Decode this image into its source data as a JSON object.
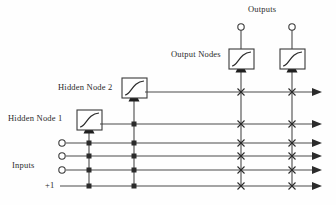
{
  "figure": {
    "type": "diagram",
    "background_color": "#fefefe",
    "line_color": "#4a4a4a",
    "marker_color": "#2b2b2b"
  },
  "labels": {
    "hidden_node_1": "Hidden Node 1",
    "hidden_node_2": "Hidden Node 2",
    "output_nodes": "Output Nodes",
    "outputs": "Outputs",
    "inputs": "Inputs",
    "bias": "+1"
  },
  "geometry": {
    "width": 336,
    "height": 205,
    "bus_rows": [
      {
        "name": "hidden-2-bus",
        "y": 92,
        "x_start": 145,
        "x_end": 322
      },
      {
        "name": "hidden-1-bus",
        "y": 124,
        "x_start": 100,
        "x_end": 322
      },
      {
        "name": "input-1-bus",
        "y": 143,
        "x_start": 64,
        "x_end": 322
      },
      {
        "name": "input-2-bus",
        "y": 156,
        "x_start": 64,
        "x_end": 322
      },
      {
        "name": "input-3-bus",
        "y": 170,
        "x_start": 64,
        "x_end": 322
      },
      {
        "name": "bias-bus",
        "y": 186,
        "x_start": 60,
        "x_end": 322
      }
    ],
    "vertical_lines": [
      {
        "name": "hidden-1-column",
        "x": 89,
        "y_top": 135,
        "y_bottom": 186
      },
      {
        "name": "hidden-2-column",
        "x": 134,
        "y_top": 103,
        "y_bottom": 186
      },
      {
        "name": "output-1-column",
        "x": 241,
        "y_top": 74,
        "y_bottom": 186
      },
      {
        "name": "output-2-column",
        "x": 292,
        "y_top": 74,
        "y_bottom": 186
      }
    ],
    "input_terminals": [
      {
        "name": "input-terminal-1",
        "x": 62,
        "y": 143
      },
      {
        "name": "input-terminal-2",
        "x": 62,
        "y": 156
      },
      {
        "name": "input-terminal-3",
        "x": 62,
        "y": 170
      }
    ],
    "output_terminals": [
      {
        "name": "output-terminal-1",
        "x": 241,
        "y": 28
      },
      {
        "name": "output-terminal-2",
        "x": 292,
        "y": 28
      }
    ],
    "nodes": [
      {
        "name": "hidden-node-1",
        "x": 77,
        "y": 110,
        "w": 25,
        "h": 20
      },
      {
        "name": "hidden-node-2",
        "x": 122,
        "y": 78,
        "w": 25,
        "h": 20
      },
      {
        "name": "output-node-1",
        "x": 229,
        "y": 49,
        "w": 25,
        "h": 20
      },
      {
        "name": "output-node-2",
        "x": 280,
        "y": 49,
        "w": 25,
        "h": 20
      }
    ],
    "connection_dots": [
      {
        "x": 89,
        "y": 143
      },
      {
        "x": 89,
        "y": 156
      },
      {
        "x": 89,
        "y": 170
      },
      {
        "x": 89,
        "y": 186
      },
      {
        "x": 134,
        "y": 124
      },
      {
        "x": 134,
        "y": 143
      },
      {
        "x": 134,
        "y": 156
      },
      {
        "x": 134,
        "y": 170
      },
      {
        "x": 134,
        "y": 186
      }
    ],
    "crossings": [
      {
        "x": 241,
        "y": 92
      },
      {
        "x": 241,
        "y": 124
      },
      {
        "x": 241,
        "y": 143
      },
      {
        "x": 241,
        "y": 156
      },
      {
        "x": 241,
        "y": 170
      },
      {
        "x": 241,
        "y": 186
      },
      {
        "x": 292,
        "y": 92
      },
      {
        "x": 292,
        "y": 124
      },
      {
        "x": 292,
        "y": 143
      },
      {
        "x": 292,
        "y": 156
      },
      {
        "x": 292,
        "y": 170
      },
      {
        "x": 292,
        "y": 186
      }
    ]
  }
}
